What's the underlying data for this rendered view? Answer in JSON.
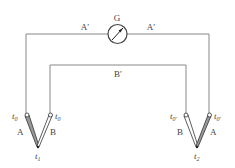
{
  "diagram": {
    "type": "thermocouple circuit",
    "galvanometer": {
      "label": "G"
    },
    "wires": {
      "outer_left_label": "A′",
      "outer_right_label": "A′",
      "inner_label": "B′"
    },
    "junction_1": {
      "left_terminal_label": "t",
      "left_terminal_sub": "0",
      "right_terminal_label": "t",
      "right_terminal_sub": "0",
      "left_leg_label": "A",
      "right_leg_label": "B",
      "tip_label": "t",
      "tip_sub": "1"
    },
    "junction_2": {
      "left_terminal_label": "t",
      "left_terminal_sub": "0′",
      "right_terminal_label": "t",
      "right_terminal_sub": "0′",
      "left_leg_label": "B",
      "right_leg_label": "A",
      "tip_label": "t",
      "tip_sub": "2"
    },
    "colors": {
      "line": "#777777",
      "leg_fill_dark": "#999999",
      "text": "#444444"
    }
  }
}
